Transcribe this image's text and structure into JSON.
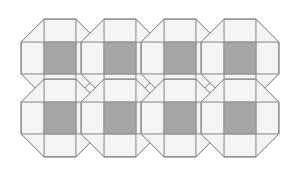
{
  "figure": {
    "background_color": "#ffffff"
  },
  "palette": {
    "background": "#ffffff",
    "tile_light_fill": "#f4f4f4",
    "tile_trapezoid_fill": "#f4f4f4",
    "tile_triangle_fill": "#f4f4f4",
    "square_fill": "#a6a6a6",
    "square_stroke": "#8c8c8c",
    "outline_stroke": "#8a8a8a",
    "inner_stroke": "#9b9b9b"
  },
  "geometry": {
    "canvas_width": 297,
    "canvas_height": 189,
    "octagon_radius": 42,
    "octagon_half_width": 39,
    "square_half_size": 16,
    "row_spacing": 60,
    "column_spacing": 120,
    "row_offset_x": 60,
    "stroke_width": 1
  },
  "chart_data": {
    "type": "diagram",
    "tile_shape": "regular octagon",
    "subdivision": [
      "central square",
      "4 trapezoids",
      "4 corner triangles"
    ],
    "rows": 2,
    "tiles_per_row": 4,
    "total_tiles": 8,
    "shaded_squares": 8,
    "octagon_centers": [
      {
        "id": "r1c1",
        "row": 1,
        "col": 1,
        "cx": 60,
        "cy": 58
      },
      {
        "id": "r1c2",
        "row": 1,
        "col": 2,
        "cx": 120,
        "cy": 58
      },
      {
        "id": "r1c3",
        "row": 1,
        "col": 3,
        "cx": 180,
        "cy": 58
      },
      {
        "id": "r1c4",
        "row": 1,
        "col": 4,
        "cx": 240,
        "cy": 58
      },
      {
        "id": "r2c1",
        "row": 2,
        "col": 1,
        "cx": 60,
        "cy": 118
      },
      {
        "id": "r2c2",
        "row": 2,
        "col": 2,
        "cx": 120,
        "cy": 118
      },
      {
        "id": "r2c3",
        "row": 2,
        "col": 3,
        "cx": 180,
        "cy": 118
      },
      {
        "id": "r2c4",
        "row": 2,
        "col": 4,
        "cx": 240,
        "cy": 118
      }
    ],
    "square_centers": [
      {
        "cx": 60,
        "cy": 58
      },
      {
        "cx": 120,
        "cy": 58
      },
      {
        "cx": 180,
        "cy": 58
      },
      {
        "cx": 240,
        "cy": 58
      },
      {
        "cx": 60,
        "cy": 118
      },
      {
        "cx": 120,
        "cy": 118
      },
      {
        "cx": 180,
        "cy": 118
      },
      {
        "cx": 240,
        "cy": 118
      }
    ],
    "legend": [],
    "annotations": [],
    "axis": {
      "show": false
    }
  }
}
